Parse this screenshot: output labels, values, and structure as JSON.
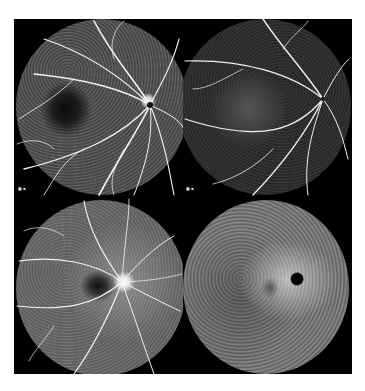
{
  "figure": {
    "layout": "2x2 grid",
    "panels": [
      {
        "id": "top-left",
        "description": "Fluorescein angiogram, early venous phase, bright retinal vessels radiating from optic disc, dark foveal avascular zone",
        "optic_disc_side": "right",
        "scale_label": "■ ▪"
      },
      {
        "id": "top-right",
        "description": "Fluorescein angiogram, darker background with bright vascular tree, optic disc on right",
        "optic_disc_side": "right",
        "scale_label": "■ ▪"
      },
      {
        "id": "bottom-left",
        "description": "Late-phase fluorescein angiogram, hyperfluorescent optic disc, dark macula, granular mottled background",
        "optic_disc_side": "right",
        "scale_label": ""
      },
      {
        "id": "bottom-right",
        "description": "Fundus autofluorescence, mottled hypo-autofluorescent spots, dark optic disc, grey background",
        "optic_disc_side": "right",
        "scale_label": ""
      }
    ],
    "colors": {
      "background": "#ffffff",
      "frame": "#000000",
      "vessel": "#f2f2f2",
      "retina_tl": "#5a5a5a",
      "retina_tr": "#3a3a3a",
      "retina_bl": "#6a6a6a",
      "retina_br": "#8c8c8c"
    }
  }
}
